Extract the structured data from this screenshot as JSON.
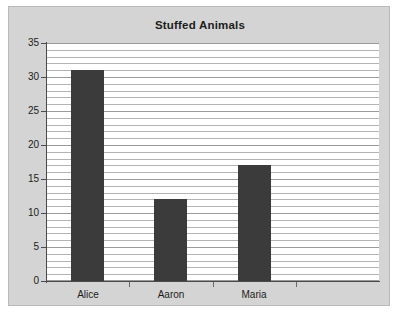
{
  "chart_data": {
    "type": "bar",
    "title": "Stuffed Animals",
    "categories": [
      "Alice",
      "Aaron",
      "Maria"
    ],
    "values": [
      31,
      12,
      17
    ],
    "xlabel": "",
    "ylabel": "",
    "ylim": [
      0,
      35
    ],
    "ytick_labels": [
      "0",
      "5",
      "10",
      "15",
      "20",
      "25",
      "30",
      "35"
    ],
    "ytick_values": [
      0,
      5,
      10,
      15,
      20,
      25,
      30,
      35
    ],
    "grid": true,
    "grid_interval": 1,
    "legend": false,
    "legend_position": "none",
    "bar_color": "#3b3b3b",
    "plot_background": "#ffffff",
    "figure_background": "#d4d4d4",
    "gridline_color": "#b3b3b3",
    "axis_color": "#4a4a4a",
    "empty_category_slots": 1
  }
}
